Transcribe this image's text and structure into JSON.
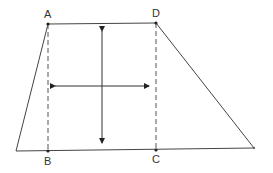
{
  "diagram": {
    "type": "trapezoid-with-height-and-midline",
    "labels": {
      "A": "A",
      "B": "B",
      "C": "C",
      "D": "D"
    },
    "points": {
      "A": [
        48,
        24
      ],
      "D": [
        156,
        23
      ],
      "B": [
        48,
        151
      ],
      "C": [
        156,
        150
      ],
      "bottom_left": [
        16,
        151
      ],
      "bottom_right": [
        254,
        148
      ]
    },
    "vertical_arrow": {
      "x": 102,
      "y1": 24,
      "y2": 150
    },
    "horizontal_arrow": {
      "y": 86,
      "x1": 48,
      "x2": 156
    },
    "colors": {
      "line": "#444444",
      "text": "#333333",
      "background": "#ffffff"
    }
  }
}
